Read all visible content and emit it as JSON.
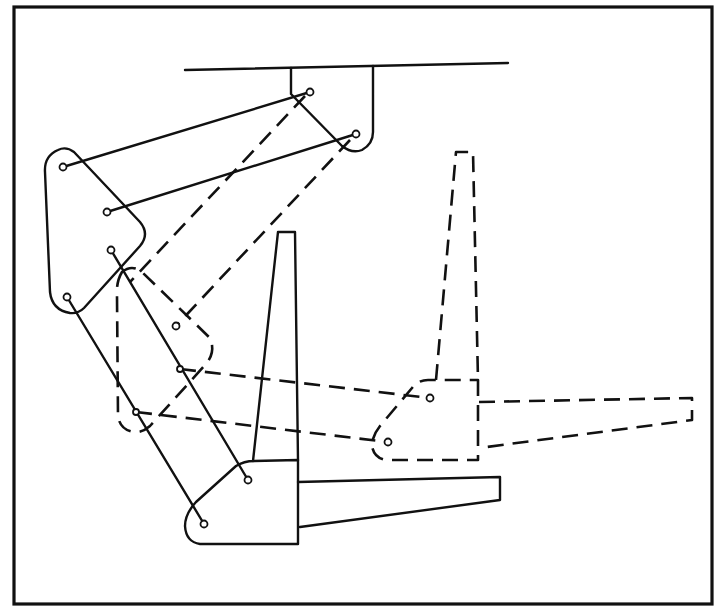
{
  "diagram": {
    "type": "mechanical-linkage",
    "colors": {
      "line": "#111111",
      "background": "#ffffff"
    },
    "frame": {
      "x": 14,
      "y": 7,
      "width": 698,
      "height": 597
    },
    "ground": {
      "line": [
        [
          185,
          70
        ],
        [
          508,
          63
        ]
      ],
      "bracket_pins": [
        [
          310,
          92
        ],
        [
          356,
          134
        ]
      ]
    },
    "positions": [
      {
        "name": "solid-position",
        "style": "solid",
        "coupler_pins": [
          [
            63,
            167
          ],
          [
            107,
            212
          ],
          [
            111,
            250
          ],
          [
            67,
            297
          ]
        ],
        "rods": [
          [
            [
              63,
              167
            ],
            [
              310,
              92
            ]
          ],
          [
            [
              107,
              212
            ],
            [
              356,
              134
            ]
          ],
          [
            [
              111,
              250
            ],
            [
              248,
              480
            ]
          ],
          [
            [
              67,
              297
            ],
            [
              204,
              524
            ]
          ]
        ],
        "output_pins": [
          [
            248,
            480
          ],
          [
            204,
            524
          ]
        ]
      },
      {
        "name": "dashed-position",
        "style": "dashed",
        "coupler_pins": [
          [
            130,
            282
          ],
          [
            176,
            326
          ],
          [
            180,
            369
          ],
          [
            136,
            412
          ]
        ],
        "rods": [
          [
            [
              310,
              92
            ],
            [
              130,
              282
            ]
          ],
          [
            [
              356,
              134
            ],
            [
              176,
              326
            ]
          ],
          [
            [
              180,
              369
            ],
            [
              430,
              398
            ]
          ],
          [
            [
              136,
              412
            ],
            [
              388,
              442
            ]
          ]
        ],
        "output_pins": [
          [
            430,
            398
          ],
          [
            388,
            442
          ]
        ]
      }
    ]
  }
}
